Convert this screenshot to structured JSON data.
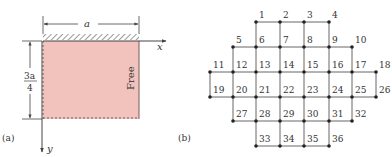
{
  "figure": {
    "panel_a": {
      "label": "(a)",
      "width_label": "a",
      "height_label_num": "3a",
      "height_label_den": "4",
      "x_axis_label": "x",
      "y_axis_label": "y",
      "edge_label": "Free",
      "fill_color": "#f2c3bd",
      "edge_color": "#7a5a58"
    },
    "panel_b": {
      "label": "(b)",
      "rows": [
        [
          null,
          null,
          1,
          2,
          3,
          4,
          null,
          null
        ],
        [
          null,
          5,
          6,
          7,
          8,
          9,
          10,
          null
        ],
        [
          11,
          12,
          13,
          14,
          15,
          16,
          17,
          18
        ],
        [
          19,
          20,
          21,
          22,
          23,
          24,
          25,
          26
        ],
        [
          null,
          27,
          28,
          29,
          30,
          31,
          32,
          null
        ],
        [
          null,
          null,
          33,
          34,
          35,
          36,
          null,
          null
        ]
      ]
    }
  }
}
